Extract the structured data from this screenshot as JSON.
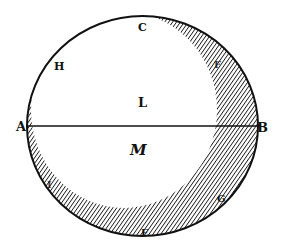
{
  "diagram": {
    "type": "geometric woodcut figure",
    "colors": {
      "ink": "#111111",
      "paper": "#ffffff"
    },
    "labels": {
      "A": "A",
      "B": "B",
      "C": "C",
      "E": "E",
      "F": "F",
      "G": "G",
      "H": "H",
      "I": "I",
      "L": "L",
      "M": "M"
    },
    "diameter": {
      "from": "A",
      "to": "B"
    }
  }
}
